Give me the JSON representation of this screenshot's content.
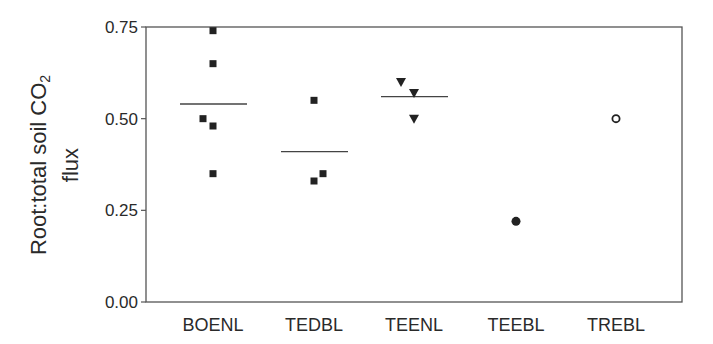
{
  "chart_data": {
    "type": "scatter",
    "title": "",
    "xlabel": "",
    "ylabel": "Root:total soil CO2 flux",
    "ylabel_lines": [
      "Root:total soil CO",
      "2",
      "flux"
    ],
    "ylim": [
      0,
      0.75
    ],
    "yticks": [
      0.0,
      0.25,
      0.5,
      0.75
    ],
    "ytick_labels": [
      "0.00",
      "0.25",
      "0.50",
      "0.75"
    ],
    "categories": [
      "BOENL",
      "TEDBL",
      "TEENL",
      "TEEBL",
      "TREBL"
    ],
    "grid": false,
    "legend": null,
    "series": [
      {
        "name": "BOENL",
        "marker": "square-filled",
        "points": [
          {
            "x_offset": 0,
            "y": 0.74
          },
          {
            "x_offset": 0,
            "y": 0.65
          },
          {
            "x_offset": -10,
            "y": 0.5
          },
          {
            "x_offset": 0,
            "y": 0.48
          },
          {
            "x_offset": 0,
            "y": 0.35
          }
        ],
        "mean": 0.54
      },
      {
        "name": "TEDBL",
        "marker": "square-filled",
        "points": [
          {
            "x_offset": 0,
            "y": 0.55
          },
          {
            "x_offset": 0,
            "y": 0.33
          },
          {
            "x_offset": 9,
            "y": 0.35
          }
        ],
        "mean": 0.41
      },
      {
        "name": "TEENL",
        "marker": "triangle-down-filled",
        "points": [
          {
            "x_offset": -13,
            "y": 0.6
          },
          {
            "x_offset": 0,
            "y": 0.57
          },
          {
            "x_offset": 0,
            "y": 0.5
          }
        ],
        "mean": 0.56
      },
      {
        "name": "TEEBL",
        "marker": "circle-filled",
        "points": [
          {
            "x_offset": 0,
            "y": 0.22
          }
        ],
        "mean": null
      },
      {
        "name": "TREBL",
        "marker": "circle-open",
        "points": [
          {
            "x_offset": 0,
            "y": 0.5
          }
        ],
        "mean": null
      }
    ]
  },
  "axis": {
    "ylabel_main": "Root:total soil CO",
    "ylabel_sub": "2",
    "ylabel_line2": "flux"
  },
  "colors": {
    "marker": "#222222",
    "axis": "#555555",
    "mean_line": "#444444",
    "text": "#2a2a2a"
  }
}
